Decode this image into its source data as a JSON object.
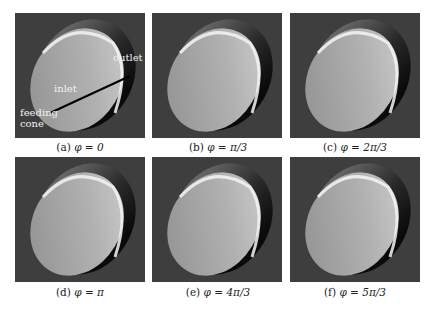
{
  "figure": {
    "panels": [
      {
        "label": "(a)",
        "phi": "φ = 0"
      },
      {
        "label": "(b)",
        "phi": "φ = π/3"
      },
      {
        "label": "(c)",
        "phi": "φ = 2π/3"
      },
      {
        "label": "(d)",
        "phi": "φ = π"
      },
      {
        "label": "(e)",
        "phi": "φ = 4π/3"
      },
      {
        "label": "(f)",
        "phi": "φ = 5π/3"
      }
    ],
    "annotations": {
      "outlet": "outlet",
      "inlet": "inlet",
      "feeding_cone_line1": "feeding",
      "feeding_cone_line2": "cone"
    }
  }
}
